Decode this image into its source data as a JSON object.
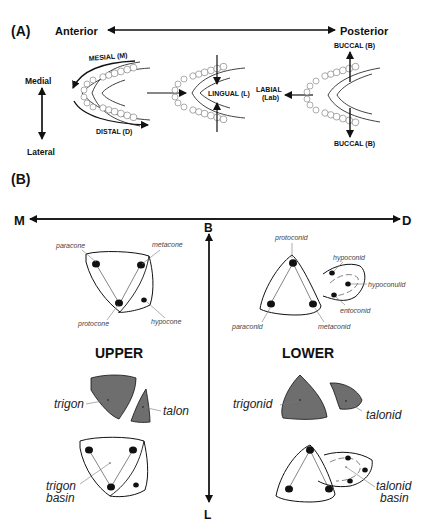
{
  "panel_a": {
    "label": "(A)",
    "axis_horizontal": {
      "left": "Anterior",
      "right": "Posterior"
    },
    "axis_vertical": {
      "top": "Medial",
      "bottom": "Lateral"
    },
    "jaw1": {
      "top_label": "MESIAL (M)",
      "bottom_label": "DISTAL (D)"
    },
    "jaw2": {
      "label": "LINGUAL (L)"
    },
    "jaw3": {
      "side_label_line1": "LABIAL",
      "side_label_line2": "(Lab)",
      "top_label": "BUCCAL (B)",
      "bottom_label": "BUCCAL (B)"
    }
  },
  "panel_b": {
    "label": "(B)",
    "axis_horizontal": {
      "left": "M",
      "right": "D"
    },
    "axis_vertical": {
      "top": "B",
      "bottom": "L"
    },
    "upper": {
      "title": "UPPER",
      "cusps": {
        "paracone": "paracone",
        "metacone": "metacone",
        "protocone": "protocone",
        "hypocone": "hypocone"
      },
      "regions": {
        "trigon": "trigon",
        "talon": "talon"
      },
      "basin_line1": "trigon",
      "basin_line2": "basin"
    },
    "lower": {
      "title": "LOWER",
      "cusps": {
        "protoconid": "protoconid",
        "hypoconid": "hypoconid",
        "hypoconulid": "hypoconulid",
        "entoconid": "entoconid",
        "paraconid": "paraconid",
        "metaconid": "metaconid"
      },
      "regions": {
        "trigonid": "trigonid",
        "talonid": "talonid"
      },
      "basin_line1": "talonid",
      "basin_line2": "basin"
    },
    "colors": {
      "fill_region": "#6e6e6e",
      "stroke": "#111111"
    }
  }
}
